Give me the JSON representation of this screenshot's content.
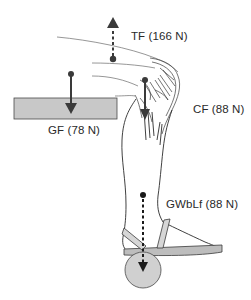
{
  "diagram": {
    "type": "free-body force diagram of leg with ankle weight",
    "colors": {
      "background": "#ffffff",
      "outline": "#2b2b2b",
      "fill_gray": "#c8c8c8",
      "arrow": "#3a3a3a"
    },
    "forces": [
      {
        "id": "tf",
        "label": "TF (166 N)",
        "direction": "up",
        "style": "dashed"
      },
      {
        "id": "cf",
        "label": "CF (88 N)",
        "direction": "down",
        "style": "solid"
      },
      {
        "id": "gf",
        "label": "GF (78 N)",
        "direction": "down",
        "style": "solid"
      },
      {
        "id": "gwblf",
        "label": "GWbLf (88 N)",
        "direction": "down",
        "style": "dashed"
      }
    ],
    "objects": [
      {
        "id": "gravity-block",
        "shape": "rectangle",
        "fill": "#c8c8c8"
      },
      {
        "id": "ankle-weight",
        "shape": "circle",
        "fill": "#d0d0d0"
      },
      {
        "id": "sandal",
        "shape": "sole with straps"
      },
      {
        "id": "leg",
        "shape": "lower leg and knee outline"
      }
    ]
  }
}
